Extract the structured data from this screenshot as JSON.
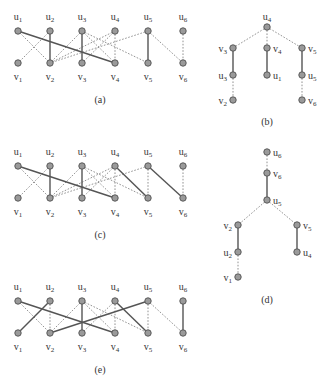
{
  "figure": {
    "panels": [
      {
        "id": "a",
        "caption": "(a)",
        "type": "bipartite",
        "origin": [
          0,
          0
        ],
        "u_labels": [
          "u1",
          "u2",
          "u3",
          "u4",
          "u5",
          "u6"
        ],
        "v_labels": [
          "v1",
          "v2",
          "v3",
          "v4",
          "v5",
          "v6"
        ],
        "solid_edges": [
          [
            "u1",
            "v4"
          ],
          [
            "u2",
            "v2"
          ],
          [
            "u3",
            "v3"
          ],
          [
            "u5",
            "v5"
          ]
        ],
        "dotted_edges": [
          [
            "u1",
            "v2"
          ],
          [
            "u2",
            "v1"
          ],
          [
            "u3",
            "v2"
          ],
          [
            "u3",
            "v4"
          ],
          [
            "u3",
            "v5"
          ],
          [
            "u4",
            "v2"
          ],
          [
            "u4",
            "v3"
          ],
          [
            "u4",
            "v4"
          ],
          [
            "u5",
            "v2"
          ],
          [
            "u5",
            "v6"
          ],
          [
            "u6",
            "v6"
          ]
        ]
      },
      {
        "id": "b",
        "caption": "(b)",
        "type": "tree",
        "nodes": [
          {
            "id": "u4",
            "x": 267,
            "y": 27,
            "label": "u4",
            "label_pos": "above"
          },
          {
            "id": "v3",
            "x": 233,
            "y": 48,
            "label": "v3",
            "label_pos": "left"
          },
          {
            "id": "v4",
            "x": 267,
            "y": 48,
            "label": "v4",
            "label_pos": "right"
          },
          {
            "id": "v5",
            "x": 302,
            "y": 48,
            "label": "v5",
            "label_pos": "right"
          },
          {
            "id": "u3",
            "x": 233,
            "y": 75,
            "label": "u3",
            "label_pos": "left"
          },
          {
            "id": "u1",
            "x": 267,
            "y": 75,
            "label": "u1",
            "label_pos": "right"
          },
          {
            "id": "u5",
            "x": 302,
            "y": 75,
            "label": "u5",
            "label_pos": "right"
          },
          {
            "id": "v2",
            "x": 233,
            "y": 100,
            "label": "v2",
            "label_pos": "left"
          },
          {
            "id": "v6",
            "x": 302,
            "y": 100,
            "label": "v6",
            "label_pos": "right"
          }
        ],
        "solid_edges": [
          [
            "v3",
            "u3"
          ],
          [
            "v4",
            "u1"
          ],
          [
            "v5",
            "u5"
          ]
        ],
        "dotted_edges": [
          [
            "u4",
            "v3"
          ],
          [
            "u4",
            "v4"
          ],
          [
            "u4",
            "v5"
          ],
          [
            "u3",
            "v2"
          ],
          [
            "u5",
            "v6"
          ]
        ],
        "caption_pos": [
          267,
          125
        ]
      },
      {
        "id": "c",
        "caption": "(c)",
        "type": "bipartite",
        "origin": [
          0,
          135
        ],
        "u_labels": [
          "u1",
          "u2",
          "u3",
          "u4",
          "u5",
          "u6"
        ],
        "v_labels": [
          "v1",
          "v2",
          "v3",
          "v4",
          "v5",
          "v6"
        ],
        "solid_edges": [
          [
            "u1",
            "v4"
          ],
          [
            "u2",
            "v2"
          ],
          [
            "u3",
            "v3"
          ],
          [
            "u4",
            "v5"
          ],
          [
            "u5",
            "v6"
          ]
        ],
        "dotted_edges": [
          [
            "u1",
            "v2"
          ],
          [
            "u2",
            "v1"
          ],
          [
            "u3",
            "v2"
          ],
          [
            "u3",
            "v4"
          ],
          [
            "u3",
            "v5"
          ],
          [
            "u4",
            "v2"
          ],
          [
            "u4",
            "v3"
          ],
          [
            "u4",
            "v4"
          ],
          [
            "u5",
            "v2"
          ],
          [
            "u5",
            "v5"
          ],
          [
            "u6",
            "v6"
          ]
        ]
      },
      {
        "id": "d",
        "caption": "(d)",
        "type": "tree",
        "nodes": [
          {
            "id": "u6",
            "x": 267,
            "y": 152,
            "label": "u6",
            "label_pos": "right"
          },
          {
            "id": "v6",
            "x": 267,
            "y": 173,
            "label": "v6",
            "label_pos": "right"
          },
          {
            "id": "u5",
            "x": 267,
            "y": 200,
            "label": "u5",
            "label_pos": "right"
          },
          {
            "id": "v2",
            "x": 238,
            "y": 225,
            "label": "v2",
            "label_pos": "left"
          },
          {
            "id": "v5",
            "x": 297,
            "y": 225,
            "label": "v5",
            "label_pos": "right"
          },
          {
            "id": "u2",
            "x": 238,
            "y": 252,
            "label": "u2",
            "label_pos": "left"
          },
          {
            "id": "u4",
            "x": 297,
            "y": 252,
            "label": "u4",
            "label_pos": "right"
          },
          {
            "id": "v1",
            "x": 238,
            "y": 277,
            "label": "v1",
            "label_pos": "left"
          }
        ],
        "solid_edges": [
          [
            "v6",
            "u5"
          ],
          [
            "v2",
            "u2"
          ],
          [
            "v5",
            "u4"
          ]
        ],
        "dotted_edges": [
          [
            "u6",
            "v6"
          ],
          [
            "u5",
            "v2"
          ],
          [
            "u5",
            "v5"
          ],
          [
            "u2",
            "v1"
          ]
        ],
        "caption_pos": [
          267,
          303
        ]
      },
      {
        "id": "e",
        "caption": "(e)",
        "type": "bipartite",
        "origin": [
          0,
          270
        ],
        "u_labels": [
          "u1",
          "u2",
          "u3",
          "u4",
          "u5",
          "u6"
        ],
        "v_labels": [
          "v1",
          "v2",
          "v3",
          "v4",
          "v5",
          "v6"
        ],
        "solid_edges": [
          [
            "u1",
            "v4"
          ],
          [
            "u2",
            "v1"
          ],
          [
            "u3",
            "v3"
          ],
          [
            "u4",
            "v5"
          ],
          [
            "u5",
            "v2"
          ],
          [
            "u6",
            "v6"
          ]
        ],
        "dotted_edges": [
          [
            "u1",
            "v2"
          ],
          [
            "u2",
            "v2"
          ],
          [
            "u3",
            "v2"
          ],
          [
            "u3",
            "v4"
          ],
          [
            "u3",
            "v5"
          ],
          [
            "u4",
            "v3"
          ],
          [
            "u4",
            "v4"
          ],
          [
            "u5",
            "v5"
          ],
          [
            "u5",
            "v6"
          ]
        ]
      }
    ],
    "bipartite_layout": {
      "x": [
        18,
        50,
        82,
        115,
        148,
        183
      ],
      "u_y": 31,
      "v_y": 63,
      "u_label_y": 20,
      "v_label_y": 80,
      "caption_y": 103,
      "caption_x": 100
    }
  }
}
